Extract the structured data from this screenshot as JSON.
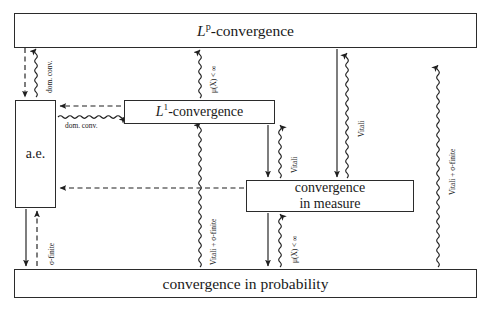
{
  "diagram": {
    "background": "#ffffff",
    "stroke": "#2b2b2b",
    "nodes": [
      {
        "id": "lp",
        "label": "L^p-convergence",
        "text_parts": {
          "base": "L",
          "sup": "p",
          "rest": "-convergence"
        }
      },
      {
        "id": "l1",
        "label": "L^1-convergence",
        "text_parts": {
          "base": "L",
          "sup": "1",
          "rest": "-convergence"
        }
      },
      {
        "id": "ae",
        "label": "a.e."
      },
      {
        "id": "meas",
        "label": "convergence in measure",
        "line1": "convergence",
        "line2": "in measure"
      },
      {
        "id": "prob",
        "label": "convergence in probability"
      }
    ],
    "edge_labels": {
      "dom_conv_vertical": "dom. conv.",
      "dom_conv_horizontal": "dom. conv.",
      "mu_finite_top": "μ(X) < ∞",
      "mu_finite_bottom": "μ(X) < ∞",
      "sigma_finite": "σ-finite",
      "vitali_sigma_finite_left": "Vitali + σ-finite",
      "vitali_sigma_finite_right": "Vitali + σ-finite",
      "vitali_mid": "Vitali",
      "vitali_right": "Vitali"
    }
  }
}
